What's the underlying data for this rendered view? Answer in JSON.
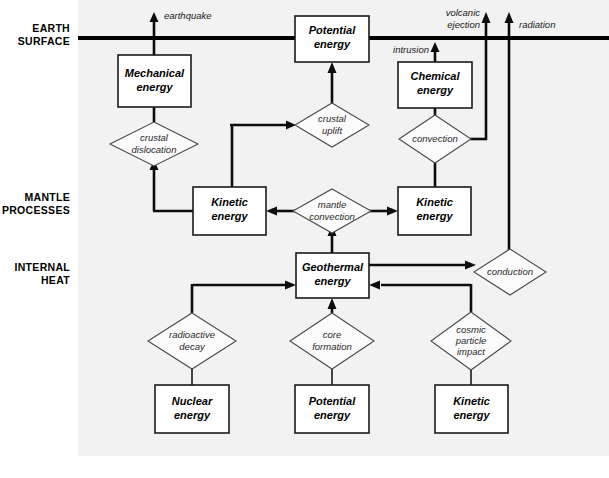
{
  "figure": {
    "type": "flowchart",
    "background_color": "#f2f2f2",
    "line_color": "#0d0d0d",
    "box_fill": "#ffffff"
  },
  "zones": [
    {
      "id": "earth-surface",
      "line1": "EARTH",
      "line2": "SURFACE"
    },
    {
      "id": "mantle-processes",
      "line1": "MANTLE",
      "line2": "PROCESSES"
    },
    {
      "id": "internal-heat",
      "line1": "INTERNAL",
      "line2": "HEAT"
    }
  ],
  "nodes": [
    {
      "id": "mechanical-energy",
      "line1": "Mechanical",
      "line2": "energy"
    },
    {
      "id": "potential-energy-surface",
      "line1": "Potential",
      "line2": "energy"
    },
    {
      "id": "chemical-energy",
      "line1": "Chemical",
      "line2": "energy"
    },
    {
      "id": "kinetic-energy-mantle-left",
      "line1": "Kinetic",
      "line2": "energy"
    },
    {
      "id": "kinetic-energy-mantle-right",
      "line1": "Kinetic",
      "line2": "energy"
    },
    {
      "id": "geothermal-energy",
      "line1": "Geothermal",
      "line2": "energy"
    },
    {
      "id": "nuclear-energy",
      "line1": "Nuclear",
      "line2": "energy"
    },
    {
      "id": "potential-energy-core",
      "line1": "Potential",
      "line2": "energy"
    },
    {
      "id": "kinetic-energy-impact",
      "line1": "Kinetic",
      "line2": "energy"
    }
  ],
  "processes": [
    {
      "id": "crustal-dislocation",
      "line1": "crustal",
      "line2": "dislocation"
    },
    {
      "id": "crustal-uplift",
      "line1": "crustal",
      "line2": "uplift"
    },
    {
      "id": "convection",
      "line1": "convection",
      "line2": ""
    },
    {
      "id": "mantle-convection",
      "line1": "mantle",
      "line2": "convection"
    },
    {
      "id": "conduction",
      "line1": "conduction",
      "line2": ""
    },
    {
      "id": "radioactive-decay",
      "line1": "radioactive",
      "line2": "decay"
    },
    {
      "id": "core-formation",
      "line1": "core",
      "line2": "formation"
    },
    {
      "id": "cosmic-particle-impact",
      "line1": "cosmic",
      "line2": "particle",
      "line3": "impact"
    }
  ],
  "outflows": [
    {
      "id": "earthquake",
      "label": "earthquake"
    },
    {
      "id": "intrusion",
      "label": "intrusion"
    },
    {
      "id": "volcanic-ejection",
      "line1": "volcanic",
      "line2": "ejection"
    },
    {
      "id": "radiation",
      "label": "radiation"
    }
  ]
}
